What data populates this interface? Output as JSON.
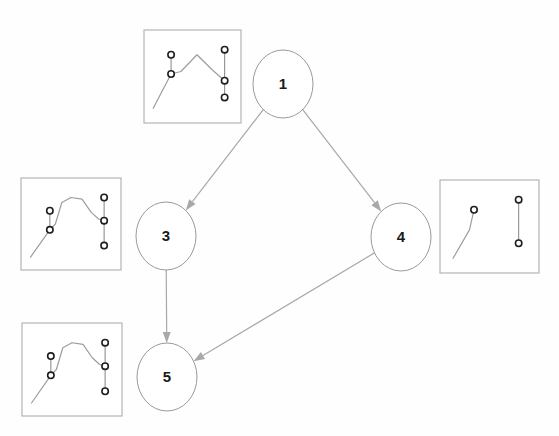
{
  "diagram": {
    "background_color": "#fefefe",
    "node_stroke_color": "#9a9a9a",
    "edge_color": "#a8a8a8",
    "thumbnail_frame_color": "#b5b5b5",
    "thumbnail_curve_color": "#9d9d9d",
    "marker_stroke_color": "#1e1e1e",
    "nodes": [
      {
        "id": "1",
        "label": "1",
        "cx": 283,
        "cy": 84,
        "rx": 30,
        "ry": 34
      },
      {
        "id": "3",
        "label": "3",
        "cx": 166,
        "cy": 236,
        "rx": 30,
        "ry": 34
      },
      {
        "id": "4",
        "label": "4",
        "cx": 401,
        "cy": 237,
        "rx": 30,
        "ry": 34
      },
      {
        "id": "5",
        "label": "5",
        "cx": 167,
        "cy": 377,
        "rx": 30,
        "ry": 34
      }
    ],
    "edges": [
      {
        "id": "e1",
        "from": "1",
        "to": "3",
        "label": ""
      },
      {
        "id": "e2",
        "from": "1",
        "to": "4",
        "label": ""
      },
      {
        "id": "e3",
        "from": "3",
        "to": "5",
        "label": ""
      },
      {
        "id": "e4",
        "from": "4",
        "to": "5",
        "label": ""
      }
    ],
    "thumbnails": [
      {
        "id": "thumb-node-1",
        "attached_to": "1",
        "x": 144,
        "y": 30,
        "width": 97,
        "height": 93,
        "marker_count": 4
      },
      {
        "id": "thumb-node-3",
        "attached_to": "3",
        "x": 21,
        "y": 178,
        "width": 100,
        "height": 92,
        "marker_count": 5
      },
      {
        "id": "thumb-node-4",
        "attached_to": "4",
        "x": 440,
        "y": 180,
        "width": 99,
        "height": 93,
        "marker_count": 3
      },
      {
        "id": "thumb-node-5",
        "attached_to": "5",
        "x": 22,
        "y": 323,
        "width": 100,
        "height": 93,
        "marker_count": 5
      }
    ]
  },
  "chart_data": {
    "type": "line",
    "subtitle": "",
    "xlabel": "",
    "ylabel": "",
    "grid": false,
    "legend_position": "none",
    "graph": {
      "node_ids": [
        "1",
        "3",
        "4",
        "5"
      ],
      "edges": [
        [
          "1",
          "3"
        ],
        [
          "1",
          "4"
        ],
        [
          "3",
          "5"
        ],
        [
          "4",
          "5"
        ]
      ],
      "roots": [
        "1"
      ],
      "leaves": [
        "5"
      ]
    },
    "panels": [
      {
        "name": "thumb-node-1",
        "node": "1",
        "xlim": [
          0,
          1
        ],
        "ylim": [
          0,
          1
        ],
        "series": [
          {
            "name": "signal",
            "x": [
              0.06,
              0.26,
              0.37,
              0.55,
              0.72,
              0.86
            ],
            "y": [
              0.12,
              0.53,
              0.56,
              0.76,
              0.58,
              0.45
            ]
          }
        ],
        "markers": [
          {
            "x": 0.26,
            "y": 0.76
          },
          {
            "x": 0.26,
            "y": 0.53
          },
          {
            "x": 0.86,
            "y": 0.82
          },
          {
            "x": 0.86,
            "y": 0.45
          },
          {
            "x": 0.86,
            "y": 0.25
          }
        ],
        "marker_bars": [
          {
            "x": 0.26,
            "y0": 0.53,
            "y1": 0.76
          },
          {
            "x": 0.86,
            "y0": 0.25,
            "y1": 0.82
          }
        ]
      },
      {
        "name": "thumb-node-3",
        "node": "3",
        "xlim": [
          0,
          1
        ],
        "ylim": [
          0,
          1
        ],
        "series": [
          {
            "name": "signal",
            "x": [
              0.06,
              0.27,
              0.33,
              0.4,
              0.5,
              0.62,
              0.72,
              0.8,
              0.86
            ],
            "y": [
              0.1,
              0.43,
              0.5,
              0.76,
              0.82,
              0.8,
              0.64,
              0.56,
              0.54
            ]
          }
        ],
        "markers": [
          {
            "x": 0.27,
            "y": 0.66
          },
          {
            "x": 0.27,
            "y": 0.43
          },
          {
            "x": 0.86,
            "y": 0.82
          },
          {
            "x": 0.86,
            "y": 0.54
          },
          {
            "x": 0.86,
            "y": 0.24
          }
        ],
        "marker_bars": [
          {
            "x": 0.27,
            "y0": 0.43,
            "y1": 0.66
          },
          {
            "x": 0.86,
            "y0": 0.24,
            "y1": 0.82
          }
        ]
      },
      {
        "name": "thumb-node-4",
        "node": "4",
        "xlim": [
          0,
          1
        ],
        "ylim": [
          0,
          1
        ],
        "series": [
          {
            "name": "signal",
            "x": [
              0.1,
              0.28,
              0.33
            ],
            "y": [
              0.12,
              0.46,
              0.7
            ]
          }
        ],
        "markers": [
          {
            "x": 0.33,
            "y": 0.7
          },
          {
            "x": 0.82,
            "y": 0.82
          },
          {
            "x": 0.82,
            "y": 0.3
          }
        ],
        "marker_bars": [
          {
            "x": 0.82,
            "y0": 0.3,
            "y1": 0.82
          }
        ]
      },
      {
        "name": "thumb-node-5",
        "node": "5",
        "xlim": [
          0,
          1
        ],
        "ylim": [
          0,
          1
        ],
        "series": [
          {
            "name": "signal",
            "x": [
              0.06,
              0.27,
              0.33,
              0.4,
              0.5,
              0.62,
              0.72,
              0.8,
              0.86
            ],
            "y": [
              0.1,
              0.43,
              0.5,
              0.76,
              0.82,
              0.8,
              0.64,
              0.56,
              0.54
            ]
          }
        ],
        "markers": [
          {
            "x": 0.27,
            "y": 0.66
          },
          {
            "x": 0.27,
            "y": 0.43
          },
          {
            "x": 0.86,
            "y": 0.82
          },
          {
            "x": 0.86,
            "y": 0.54
          },
          {
            "x": 0.86,
            "y": 0.24
          }
        ],
        "marker_bars": [
          {
            "x": 0.27,
            "y0": 0.43,
            "y1": 0.66
          },
          {
            "x": 0.86,
            "y0": 0.24,
            "y1": 0.82
          }
        ]
      }
    ]
  }
}
